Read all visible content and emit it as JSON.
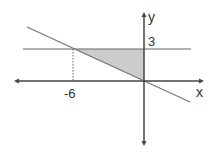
{
  "diagram": {
    "axes": {
      "x_label": "x",
      "y_label": "y"
    },
    "labels": {
      "y_tick": "3",
      "x_tick": "-6"
    },
    "lines": [
      {
        "name": "horizontal-line",
        "equation": "y = 3"
      },
      {
        "name": "sloped-line",
        "equation": "y = -x/2",
        "through": [
          [
            0,
            0
          ],
          [
            -6,
            3
          ]
        ]
      }
    ],
    "shaded_region": {
      "vertices": [
        [
          -6,
          3
        ],
        [
          0,
          3
        ],
        [
          0,
          0
        ]
      ]
    },
    "colors": {
      "axis": "#444444",
      "line": "#666666",
      "shade": "#cccccc"
    }
  }
}
